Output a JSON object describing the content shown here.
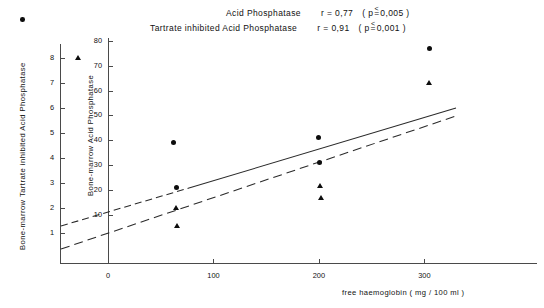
{
  "header": {
    "line1": {
      "name": "Acid Phosphatase",
      "stat": "r = 0,77",
      "p": "(p ≦ 0,005 )"
    },
    "line2": {
      "name": "Tartrate inhibited Acid Phosphatase",
      "stat": "r = 0,91",
      "p": "(p ≦ 0,001 )"
    },
    "line1_words": [
      "Acid",
      "Phosphatase"
    ],
    "line2_words": [
      "Tartrate",
      "inhibited",
      "Acid",
      "Phosphatase"
    ],
    "r1_label": "r = 0,77",
    "r2_label": "r = 0,91",
    "p1_prefix": "( p",
    "p1_value": "0,005 )",
    "p2_prefix": "( p",
    "p2_value": "0,001 )",
    "le_glyph": "≦",
    "le_top": "<",
    "le_bottom": "="
  },
  "axes": {
    "y_left": {
      "title": "Bone-marrow  Tartrate  inhibited  Acid  Phosphatase",
      "ticks": [
        "1",
        "2",
        "3",
        "4",
        "5",
        "6",
        "7",
        "8"
      ],
      "values": [
        1,
        2,
        3,
        4,
        5,
        6,
        7,
        8
      ],
      "min": 0,
      "max": 8.6
    },
    "y_right": {
      "title": "Bone-marrow  Acid  Phosphatase",
      "ticks": [
        "10",
        "20",
        "30",
        "40",
        "50",
        "60",
        "70",
        "80"
      ],
      "values": [
        10,
        20,
        30,
        40,
        50,
        60,
        70,
        80
      ],
      "min": 0,
      "max": 86
    },
    "x": {
      "label": "free   haemoglobin  ( mg / 100 ml )",
      "ticks": [
        "0",
        "100",
        "200",
        "300"
      ],
      "values": [
        0,
        100,
        200,
        300
      ],
      "min": 0,
      "max": 330
    }
  },
  "chart_data": {
    "type": "scatter",
    "title": "",
    "xlabel": "free   haemoglobin  ( mg / 100 ml )",
    "ylabel": "Bone-marrow  Acid  Phosphatase",
    "ylabel2": "Bone-marrow  Tartrate  inhibited  Acid  Phosphatase",
    "xlim": [
      0,
      330
    ],
    "ylim": [
      0,
      86
    ],
    "ylim2": [
      0,
      8.6
    ],
    "grid": false,
    "legend": "none",
    "series": [
      {
        "name": "Acid Phosphatase",
        "marker": "circle",
        "axis": "y_right",
        "r": 0.77,
        "p": "≦ 0,005",
        "points": [
          {
            "x": 62,
            "y": 39
          },
          {
            "x": 65,
            "y": 21
          },
          {
            "x": 200,
            "y": 41
          },
          {
            "x": 201,
            "y": 31
          },
          {
            "x": 305,
            "y": 77
          }
        ]
      },
      {
        "name": "Tartrate inhibited Acid Phosphatase",
        "marker": "triangle",
        "axis": "y_left",
        "r": 0.91,
        "p": "≦ 0,001",
        "points": [
          {
            "x": 65,
            "y": 2.0
          },
          {
            "x": 66,
            "y": 1.3
          },
          {
            "x": 201,
            "y": 2.9
          },
          {
            "x": 202,
            "y": 2.4
          },
          {
            "x": 305,
            "y": 7.0
          }
        ]
      }
    ],
    "fits": [
      {
        "name": "Acid Phosphatase fit",
        "style": "solid-extrapolated",
        "x0": 0,
        "y0": 15,
        "x1": 318,
        "y1": 62
      },
      {
        "name": "Tartrate inhibited fit",
        "style": "dashed",
        "x0": 0,
        "y0": 0.55,
        "x1": 318,
        "y1": 6.1
      }
    ]
  },
  "legend_markers": {
    "circle": "acid-phosphatase-marker",
    "triangle": "tartrate-inhibited-marker"
  }
}
